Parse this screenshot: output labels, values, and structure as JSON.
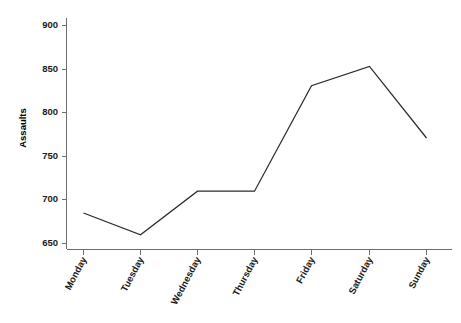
{
  "chart_data": {
    "type": "line",
    "title": "",
    "subtitle": "",
    "xlabel": "",
    "ylabel": "Assaults",
    "categories": [
      "Monday",
      "Tuesday",
      "Wednesday",
      "Thursday",
      "Friday",
      "Saturday",
      "Sunday"
    ],
    "values": [
      685,
      660,
      710,
      710,
      831,
      853,
      771
    ],
    "series": [
      {
        "name": "Assaults",
        "values": [
          685,
          660,
          710,
          710,
          831,
          853,
          771
        ]
      }
    ],
    "ylim": [
      640,
      910
    ],
    "yticks": [
      650,
      700,
      750,
      800,
      850,
      900
    ],
    "ytick_labels": [
      "650",
      "700",
      "750",
      "800",
      "850",
      "900"
    ],
    "xtick_labels": [
      "Monday",
      "Tuesday",
      "Wednesday",
      "Thursday",
      "Friday",
      "Saturday",
      "Sunday"
    ],
    "grid": false,
    "legend": false,
    "legend_position": "none",
    "line_color": "#2b2b2b",
    "axis_color": "#6e6e6e",
    "background_color": "#ffffff",
    "xtick_label_rotation": -62
  },
  "axis": {
    "y_title": "Assaults",
    "y_labels": [
      "900",
      "850",
      "800",
      "750",
      "700",
      "650"
    ],
    "x_labels": [
      "Monday",
      "Tuesday",
      "Wednesday",
      "Thursday",
      "Friday",
      "Saturday",
      "Sunday"
    ]
  }
}
